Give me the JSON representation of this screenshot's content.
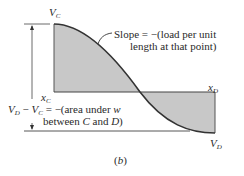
{
  "diagram": {
    "caption": "(b)",
    "labels": {
      "vc": {
        "main": "V",
        "sub": "C"
      },
      "vd": {
        "main": "V",
        "sub": "D"
      },
      "xc": {
        "main": "x",
        "sub": "C"
      },
      "xd": {
        "main": "x",
        "sub": "D"
      }
    },
    "slope_annotation": {
      "line1": "Slope = −(load per unit",
      "line2": "length at that point)"
    },
    "area_annotation": {
      "lhs_v1": "V",
      "lhs_s1": "D",
      "minus": " − ",
      "lhs_v2": "V",
      "lhs_s2": "C",
      "line1_rest": " = −(area under ",
      "w": "w",
      "line2_pre": "between ",
      "c": "C",
      "and": " and ",
      "d": "D",
      "close": ")"
    },
    "colors": {
      "fill": "#c8c8c8",
      "curve": "#333333",
      "line": "#444444"
    }
  }
}
